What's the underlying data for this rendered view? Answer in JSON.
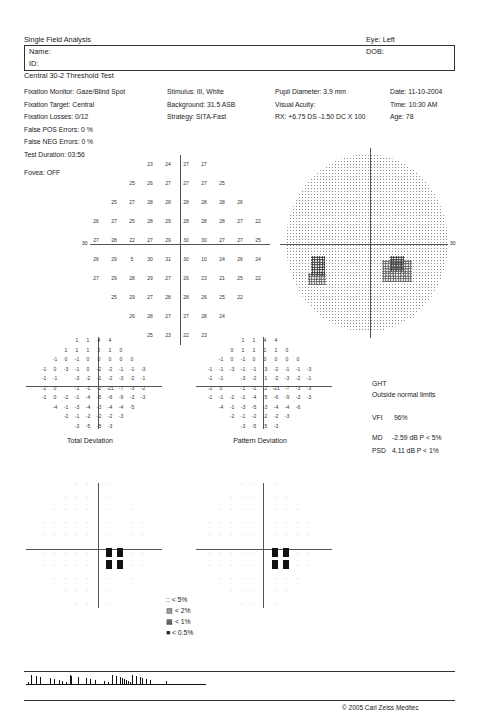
{
  "header": {
    "title": "Single Field Analysis",
    "eye": "Eye: Left",
    "name_label": "Name:",
    "id_label": "ID:",
    "dob_label": "DOB:",
    "test_name": "Central 30-2 Threshold Test"
  },
  "info": {
    "col1": [
      "Fixation Monitor: Gaze/Blind Spot",
      "Fixation Target: Central",
      "Fixation Losses: 0/12",
      "False POS Errors:  0 %",
      "False NEG Errors:  0 %",
      "Test Duration: 03:56",
      "",
      "Fovea: OFF"
    ],
    "col2": [
      "Stimulus: III, White",
      "Background: 31.5 ASB",
      "Strategy: SITA-Fast"
    ],
    "col3": [
      "Pupil Diameter: 3.9 mm",
      "Visual Acuity:",
      "RX: +6.75 DS  -1.50 DC  X 100"
    ],
    "col4": [
      "Date: 11-10-2004",
      "Time: 10:30 AM",
      "Age: 78"
    ]
  },
  "threshold": {
    "axis_label_left": "30",
    "axis_label_right": "30",
    "rows": [
      [
        "23",
        "24",
        "27",
        "27"
      ],
      [
        "25",
        "26",
        "27",
        "27",
        "27",
        "25"
      ],
      [
        "25",
        "27",
        "28",
        "28",
        "28",
        "28",
        "28",
        "26"
      ],
      [
        "26",
        "27",
        "25",
        "28",
        "29",
        "28",
        "28",
        "28",
        "27",
        "22"
      ],
      [
        "27",
        "28",
        "22",
        "27",
        "29",
        "30",
        "30",
        "27",
        "27",
        "25"
      ],
      [
        "26",
        "29",
        "5",
        "30",
        "31",
        "30",
        "10",
        "24",
        "26",
        "24"
      ],
      [
        "27",
        "29",
        "28",
        "29",
        "27",
        "26",
        "23",
        "21",
        "25",
        "22"
      ],
      [
        "25",
        "29",
        "27",
        "28",
        "28",
        "26",
        "25",
        "22"
      ],
      [
        "26",
        "28",
        "27",
        "27",
        "28",
        "24"
      ],
      [
        "25",
        "23",
        "22",
        "23"
      ]
    ]
  },
  "total_deviation": {
    "caption": "Total Deviation",
    "rows": [
      [
        "1",
        "1",
        "4",
        "4"
      ],
      [
        "1",
        "1",
        "1",
        "2",
        "1",
        "0"
      ],
      [
        "-1",
        "0",
        "-1",
        "0",
        "0",
        "0",
        "0",
        "0"
      ],
      [
        "-1",
        "0",
        "-3",
        "-1",
        "0",
        "-2",
        "-2",
        "-1",
        "-1",
        "-3"
      ],
      [
        "-1",
        "-1",
        "",
        "-3",
        "-2",
        "-1",
        "-2",
        "-3",
        "-2",
        "-1"
      ],
      [
        "-2",
        "0",
        "",
        "-1",
        "-1",
        "-2",
        "-21",
        "-7",
        "-3",
        "-2"
      ],
      [
        "-1",
        "0",
        "-2",
        "-1",
        "-4",
        "-5",
        "-6",
        "-9",
        "-3",
        "-3"
      ],
      [
        "-4",
        "-1",
        "-3",
        "-4",
        "-3",
        "-4",
        "-4",
        "-5"
      ],
      [
        "-2",
        "-1",
        "-2",
        "-2",
        "-2",
        "-3"
      ],
      [
        "-3",
        "-5",
        "-5",
        "-3"
      ]
    ]
  },
  "pattern_deviation": {
    "caption": "Pattern Deviation",
    "rows": [
      [
        "1",
        "1",
        "4",
        "4"
      ],
      [
        "0",
        "1",
        "1",
        "1",
        "1",
        "0"
      ],
      [
        "-1",
        "0",
        "-1",
        "0",
        "0",
        "0",
        "0",
        "0"
      ],
      [
        "-1",
        "-1",
        "-3",
        "-1",
        "-1",
        "-3",
        "-2",
        "-1",
        "-1",
        "-3"
      ],
      [
        "-1",
        "-1",
        "",
        "-3",
        "-2",
        "-1",
        "-2",
        "-3",
        "-2",
        "-1"
      ],
      [
        "-2",
        "0",
        "",
        "-1",
        "-1",
        "-2",
        "-21",
        "-7",
        "-3",
        "-3"
      ],
      [
        "-1",
        "-1",
        "-2",
        "-1",
        "-4",
        "-5",
        "-6",
        "-9",
        "-3",
        "-3"
      ],
      [
        "-4",
        "-1",
        "-3",
        "-5",
        "-3",
        "-4",
        "-4",
        "-6"
      ],
      [
        "-2",
        "-1",
        "-2",
        "-2",
        "-2",
        "-3"
      ],
      [
        "-3",
        "-5",
        "-5",
        "-3"
      ]
    ]
  },
  "indices": {
    "ght_label": "GHT",
    "ght_value": "Outside normal limits",
    "vfi_label": "VFI",
    "vfi_value": "96%",
    "md_label": "MD",
    "md_value": "-2.59 dB  P < 5%",
    "psd_label": "PSD",
    "psd_value": "4.11 dB  P < 1%"
  },
  "legend": {
    "items": [
      {
        "symbol": "::",
        "label": "< 5%"
      },
      {
        "symbol": "▨",
        "label": "< 2%"
      },
      {
        "symbol": "▩",
        "label": "< 1%"
      },
      {
        "symbol": "■",
        "label": "< 0.5%"
      }
    ]
  },
  "footer": {
    "copyright": "© 2005 Carl Zeiss Meditec"
  }
}
